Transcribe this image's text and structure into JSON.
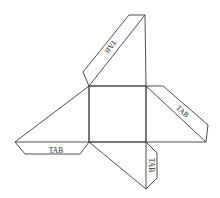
{
  "diagram": {
    "type": "pyramid-net",
    "stroke_color": "#3a3a3a",
    "background": "#ffffff",
    "base_square": [
      [
        89,
        86
      ],
      [
        146,
        86
      ],
      [
        146,
        142
      ],
      [
        89,
        142
      ]
    ],
    "faces": [
      {
        "name": "top-face",
        "points": [
          [
            89,
            86
          ],
          [
            146,
            86
          ],
          [
            145,
            15
          ]
        ]
      },
      {
        "name": "right-face",
        "points": [
          [
            146,
            86
          ],
          [
            146,
            142
          ],
          [
            206,
            142
          ]
        ]
      },
      {
        "name": "bottom-face",
        "points": [
          [
            89,
            142
          ],
          [
            146,
            142
          ],
          [
            146,
            189
          ]
        ]
      },
      {
        "name": "left-face",
        "points": [
          [
            89,
            86
          ],
          [
            89,
            142
          ],
          [
            15,
            142
          ]
        ]
      }
    ],
    "tabs": [
      {
        "name": "tab-top",
        "label": "TAB",
        "points": [
          [
            89,
            86
          ],
          [
            83,
            72
          ],
          [
            129,
            15
          ],
          [
            145,
            15
          ]
        ],
        "label_pos": [
          110,
          46
        ],
        "rotation": 128
      },
      {
        "name": "tab-right",
        "label": "TAB",
        "points": [
          [
            146,
            86
          ],
          [
            163,
            86
          ],
          [
            208,
            125
          ],
          [
            206,
            142
          ]
        ],
        "label_pos": [
          182,
          112
        ],
        "rotation": 40
      },
      {
        "name": "tab-bottom",
        "label": "TAB",
        "points": [
          [
            146,
            142
          ],
          [
            157,
            153
          ],
          [
            157,
            178
          ],
          [
            146,
            189
          ]
        ],
        "label_pos": [
          151,
          165
        ],
        "rotation": 90
      },
      {
        "name": "tab-left",
        "label": "TAB",
        "points": [
          [
            15,
            142
          ],
          [
            25,
            154
          ],
          [
            80,
            154
          ],
          [
            89,
            142
          ]
        ],
        "label_pos": [
          56,
          151
        ],
        "rotation": 0
      }
    ]
  }
}
